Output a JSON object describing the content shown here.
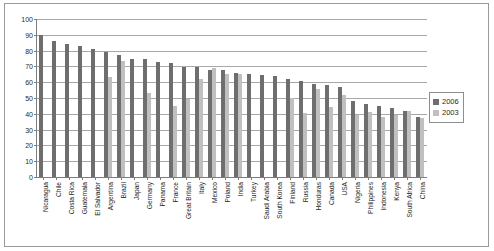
{
  "chart_data": {
    "type": "bar",
    "title": "",
    "xlabel": "",
    "ylabel": "",
    "ylim": [
      0,
      100
    ],
    "yticks": [
      0,
      10,
      20,
      30,
      40,
      50,
      60,
      70,
      80,
      90,
      100
    ],
    "grid": true,
    "legend_position": "right",
    "categories": [
      "Nicaragua",
      "Chile",
      "Costa Rica",
      "Guatemala",
      "El Salvador",
      "Argentina",
      "Brazil",
      "Japan",
      "Germany",
      "Panama",
      "France",
      "Great Britain",
      "Italy",
      "Mexico",
      "Poland",
      "India",
      "Turkey",
      "Saudi Arabia",
      "South Korea",
      "Finland",
      "Russia",
      "Honduras",
      "Canada",
      "USA",
      "Nigeria",
      "Philippines",
      "Indonesia",
      "Kenya",
      "South Africa",
      "China"
    ],
    "series": [
      {
        "name": "2006",
        "color": "#6e6e6e",
        "values": [
          90,
          86,
          84,
          83,
          81,
          79,
          77.5,
          75,
          74.5,
          72.5,
          72,
          69.5,
          69.5,
          68,
          67.5,
          66,
          65.5,
          64.5,
          64,
          62,
          61,
          59,
          58,
          57,
          48,
          46,
          45,
          43.5,
          42,
          38
        ]
      },
      {
        "name": "2003",
        "color": "#c0c0c0",
        "values": [
          null,
          null,
          null,
          null,
          null,
          63.5,
          73.5,
          null,
          53,
          null,
          45,
          49.5,
          62,
          69,
          65,
          65,
          null,
          null,
          null,
          50,
          40.5,
          56,
          44,
          52,
          39,
          41,
          38,
          39,
          41.5,
          37.5
        ]
      }
    ]
  },
  "legend": {
    "items": [
      {
        "label": "2006",
        "color": "#6e6e6e"
      },
      {
        "label": "2003",
        "color": "#c0c0c0"
      }
    ]
  }
}
